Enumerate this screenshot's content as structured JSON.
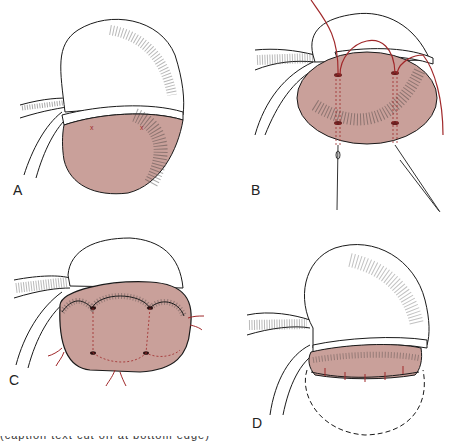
{
  "figure": {
    "colors": {
      "tissue_fill": "#C9A09A",
      "suture": "#A0282A",
      "outline": "#1a1a1a",
      "background": "#ffffff"
    },
    "panels": [
      {
        "id": "A",
        "label": "A"
      },
      {
        "id": "B",
        "label": "B"
      },
      {
        "id": "C",
        "label": "C"
      },
      {
        "id": "D",
        "label": "D"
      }
    ],
    "caption": "(caption text cut off at bottom edge)"
  }
}
